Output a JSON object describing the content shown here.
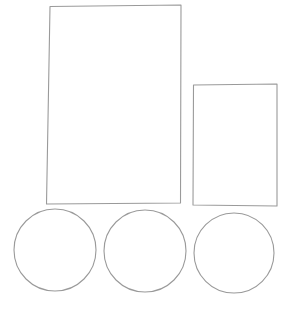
{
  "canvas": {
    "width": 296,
    "height": 312,
    "background_color": "#ffffff",
    "description": "hand-drawn line sketch of two rectangles and three circles"
  },
  "style": {
    "stroke_color": "#9a9a9a",
    "stroke_color_dark": "#8a8a8a",
    "stroke_width": 1.1,
    "fill": "none"
  },
  "shapes": [
    {
      "id": "large-rectangle",
      "type": "rectangle",
      "label": "Large rectangle",
      "x": 49,
      "y": 6,
      "width": 132,
      "height": 198,
      "corners": [
        [
          50.0,
          6.5
        ],
        [
          181.0,
          5.0
        ],
        [
          180.5,
          203.0
        ],
        [
          46.5,
          204.0
        ]
      ],
      "stroke": "#9a9a9a"
    },
    {
      "id": "small-rectangle",
      "type": "rectangle",
      "label": "Small rectangle",
      "x": 193,
      "y": 84,
      "width": 84,
      "height": 122,
      "corners": [
        [
          193.5,
          85.0
        ],
        [
          277.0,
          84.0
        ],
        [
          277.0,
          206.0
        ],
        [
          193.0,
          205.0
        ]
      ],
      "stroke": "#9a9a9a"
    },
    {
      "id": "circle-left",
      "type": "circle",
      "label": "Left circle",
      "cx": 55,
      "cy": 250,
      "r": 41,
      "stroke": "#9a9a9a"
    },
    {
      "id": "circle-middle",
      "type": "circle",
      "label": "Middle circle",
      "cx": 145,
      "cy": 251,
      "r": 41,
      "stroke": "#9a9a9a"
    },
    {
      "id": "circle-right",
      "type": "circle",
      "label": "Right circle",
      "cx": 234,
      "cy": 253,
      "r": 40,
      "stroke": "#9a9a9a"
    }
  ]
}
